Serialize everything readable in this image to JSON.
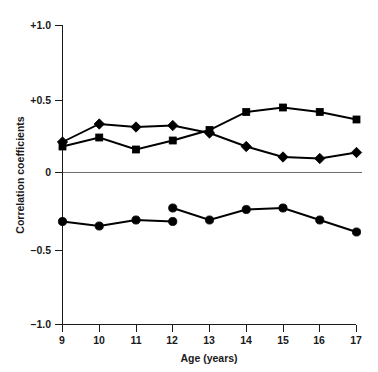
{
  "chart_data": {
    "type": "line",
    "title": "",
    "xlabel": "Age (years)",
    "ylabel": "Correlation coefficients",
    "x": [
      9,
      10,
      11,
      12,
      13,
      14,
      15,
      16,
      17
    ],
    "xtick_labels": [
      "9",
      "10",
      "11",
      "12",
      "13",
      "14",
      "15",
      "16",
      "17"
    ],
    "ytick_labels": [
      "+1.0",
      "+0.5",
      "0",
      "–0.5",
      "–1.0"
    ],
    "ytick_values": [
      1.0,
      0.5,
      0,
      -0.5,
      -1.0
    ],
    "xlim": [
      9,
      17
    ],
    "ylim": [
      -1.0,
      1.0
    ],
    "grid": false,
    "legend": "none",
    "zero_reference_line": true,
    "series": [
      {
        "name": "square-series",
        "marker": "square",
        "values": [
          0.19,
          0.25,
          0.17,
          0.23,
          0.3,
          0.42,
          0.45,
          0.42,
          0.37
        ]
      },
      {
        "name": "diamond-series",
        "marker": "diamond",
        "values": [
          0.22,
          0.34,
          0.32,
          0.33,
          0.28,
          0.19,
          0.12,
          0.11,
          0.15
        ]
      },
      {
        "name": "circle-series",
        "marker": "circle",
        "values": [
          -0.31,
          -0.34,
          -0.3,
          -0.31,
          -0.3,
          -0.23,
          -0.22,
          -0.3,
          -0.38
        ],
        "segment_break_after_index": 3,
        "values_secondary": {
          "12": -0.22
        }
      }
    ]
  },
  "axis": {
    "y_axis_title": "Correlation coefficients",
    "x_axis_title": "Age (years)"
  },
  "colors": {
    "ink": "#000000",
    "axis": "#1a1a1a",
    "zero_line": "#6e6e6e",
    "background": "#ffffff"
  }
}
